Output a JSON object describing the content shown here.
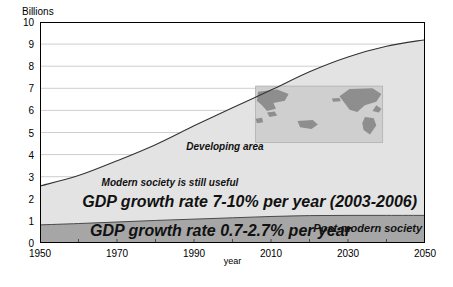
{
  "chart_data": {
    "type": "area",
    "title": "",
    "ylabel": "Billions",
    "xlabel": "year",
    "xlim": [
      1950,
      2050
    ],
    "ylim": [
      0,
      10
    ],
    "grid": true,
    "legend": "none",
    "x": [
      1950,
      1960,
      1970,
      1980,
      1990,
      2000,
      2010,
      2020,
      2030,
      2040,
      2050
    ],
    "series": [
      {
        "name": "Post-modern society",
        "fill_color": "#a6a6a6",
        "values": [
          0.82,
          0.88,
          0.95,
          1.02,
          1.08,
          1.14,
          1.2,
          1.24,
          1.25,
          1.25,
          1.25
        ]
      },
      {
        "name": "Developing area",
        "fill_color": "#e3e3e3",
        "values": [
          2.58,
          3.05,
          3.72,
          4.45,
          5.3,
          6.12,
          6.92,
          7.75,
          8.42,
          8.9,
          9.2
        ]
      }
    ],
    "ytick_labels": [
      "0",
      "1",
      "2",
      "3",
      "4",
      "5",
      "6",
      "7",
      "8",
      "9",
      "10"
    ],
    "ytick_values": [
      0,
      1,
      2,
      3,
      4,
      5,
      6,
      7,
      8,
      9,
      10
    ],
    "xtick_labels": [
      "1950",
      "1970",
      "1990",
      "2010",
      "2030",
      "2050"
    ],
    "xtick_values": [
      1950,
      1970,
      1990,
      2010,
      2030,
      2050
    ],
    "xminor_step": 10,
    "annotations": [
      {
        "name": "developing-area",
        "text": "Developing area",
        "x": 1988,
        "y": 4.3
      },
      {
        "name": "modern-society",
        "text": "Modern society is still useful",
        "x": 1966,
        "y": 2.65
      },
      {
        "name": "gdp-developing",
        "text": "GDP growth rate 7-10% per year (2003-2006)",
        "x": 1961,
        "y": 1.95
      },
      {
        "name": "gdp-postmodern",
        "text": "GDP growth rate 0.7-2.7% per year",
        "x": 1963,
        "y": 0.62
      },
      {
        "name": "post-modern-society",
        "text": "Post-modern society",
        "x": 2021,
        "y": 0.62
      }
    ],
    "inset_map": {
      "name": "world-map-inset",
      "ocean_color": "#cfcfcf",
      "land_color": "#8e8e8e",
      "x_range": [
        2006,
        2039
      ],
      "y_range": [
        4.55,
        7.1
      ]
    }
  }
}
